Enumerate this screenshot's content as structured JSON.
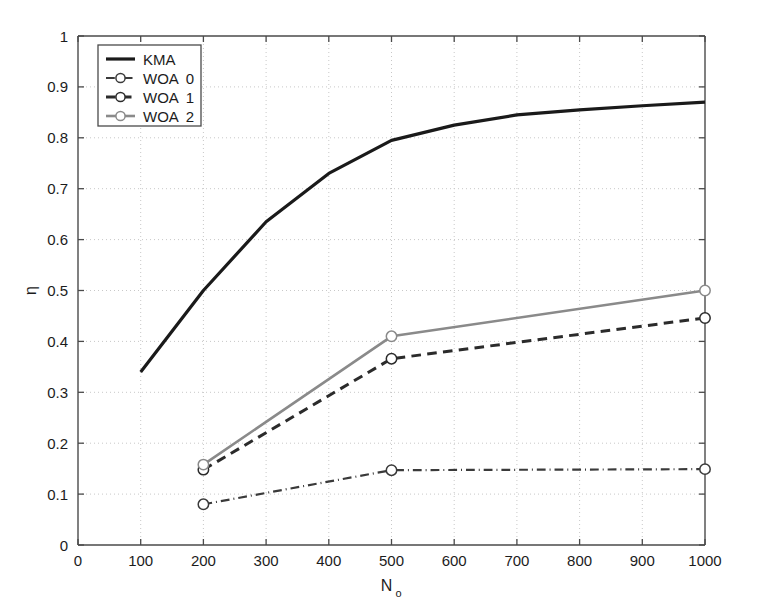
{
  "chart_data": {
    "type": "line",
    "title": "",
    "xlabel": "N_o",
    "xlabel_base": "N",
    "xlabel_sub": "o",
    "ylabel": "η",
    "xlim": [
      0,
      1000
    ],
    "ylim": [
      0,
      1
    ],
    "grid": true,
    "x_ticks": [
      0,
      100,
      200,
      300,
      400,
      500,
      600,
      700,
      800,
      900,
      1000
    ],
    "x_tick_labels": [
      "0",
      "100",
      "200",
      "300",
      "400",
      "500",
      "600",
      "700",
      "800",
      "900",
      "1000"
    ],
    "y_ticks": [
      0,
      0.1,
      0.2,
      0.3,
      0.4,
      0.5,
      0.6,
      0.7,
      0.8,
      0.9,
      1
    ],
    "y_tick_labels": [
      "0",
      "0.1",
      "0.2",
      "0.3",
      "0.4",
      "0.5",
      "0.6",
      "0.7",
      "0.8",
      "0.9",
      "1"
    ],
    "legend_position": "upper-left",
    "series": [
      {
        "name": "KMA",
        "legend_label": "KMA",
        "style": "solid",
        "color": "#1a1a1a",
        "width": 3.2,
        "marker": "none",
        "x": [
          100,
          200,
          300,
          400,
          500,
          600,
          700,
          800,
          900,
          1000
        ],
        "y": [
          0.34,
          0.5,
          0.635,
          0.73,
          0.795,
          0.825,
          0.845,
          0.855,
          0.863,
          0.87
        ]
      },
      {
        "name": "WOA 0",
        "legend_label_base": "WOA",
        "legend_label_num": "0",
        "style": "dashdot",
        "color": "#3a3a3a",
        "width": 2.2,
        "marker": "circle",
        "x": [
          200,
          500,
          1000
        ],
        "y": [
          0.08,
          0.147,
          0.149
        ]
      },
      {
        "name": "WOA 1",
        "legend_label_base": "WOA",
        "legend_label_num": "1",
        "style": "dashed",
        "color": "#2b2b2b",
        "width": 3.0,
        "marker": "circle",
        "x": [
          200,
          500,
          1000
        ],
        "y": [
          0.148,
          0.366,
          0.446
        ]
      },
      {
        "name": "WOA 2",
        "legend_label_base": "WOA",
        "legend_label_num": "2",
        "style": "solid",
        "color": "#8a8a8a",
        "width": 2.6,
        "marker": "circle",
        "x": [
          200,
          500,
          1000
        ],
        "y": [
          0.158,
          0.41,
          0.5
        ]
      }
    ],
    "colors": {
      "axis": "#4a4a4a",
      "grid": "#c8c8c8",
      "background": "#ffffff",
      "text": "#1c1c1c",
      "kma": "#1a1a1a",
      "woa0": "#3a3a3a",
      "woa1": "#2b2b2b",
      "woa2": "#8a8a8a"
    }
  }
}
